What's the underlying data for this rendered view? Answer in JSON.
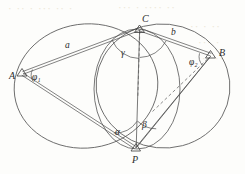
{
  "figure": {
    "background_color": "#fdfdfb",
    "ink_color": "#4a4a4a",
    "points": [
      {
        "id": "A",
        "label": "A",
        "x": 22,
        "y": 73,
        "label_dx": -10,
        "label_dy": 4
      },
      {
        "id": "B",
        "label": "B",
        "x": 211,
        "y": 55,
        "label_dx": 8,
        "label_dy": 0
      },
      {
        "id": "C",
        "label": "C",
        "x": 140,
        "y": 29,
        "label_dx": 3,
        "label_dy": -7
      },
      {
        "id": "P",
        "label": "P",
        "x": 136,
        "y": 148,
        "label_dx": 1,
        "label_dy": 13
      }
    ],
    "side_labels": [
      {
        "id": "a",
        "label": "a",
        "x": 68,
        "y": 45
      },
      {
        "id": "b",
        "label": "b",
        "x": 174,
        "y": 32
      }
    ],
    "angle_labels": [
      {
        "id": "gamma",
        "label": "γ",
        "x": 125,
        "y": 52
      },
      {
        "id": "phi1",
        "label": "φ₁",
        "x": 36,
        "y": 76
      },
      {
        "id": "phi2",
        "label": "φ₂",
        "x": 195,
        "y": 61
      },
      {
        "id": "alpha",
        "label": "α",
        "x": 119,
        "y": 131
      },
      {
        "id": "beta",
        "label": "β",
        "x": 146,
        "y": 124
      }
    ],
    "circles": [
      {
        "id": "left-circle",
        "cx": 86,
        "cy": 86,
        "rx": 72,
        "ry": 62,
        "rotate": -8
      },
      {
        "id": "right-circle",
        "cx": 163,
        "cy": 86,
        "rx": 67,
        "ry": 62,
        "rotate": 6
      },
      {
        "id": "middle-circle",
        "cx": 137,
        "cy": 89,
        "rx": 43,
        "ry": 60,
        "rotate": 0
      }
    ],
    "segments": [
      {
        "id": "AC",
        "from": "A",
        "to": "C",
        "style": "double"
      },
      {
        "id": "CB",
        "from": "C",
        "to": "B",
        "style": "double"
      },
      {
        "id": "AP",
        "from": "A",
        "to": "P",
        "style": "double"
      },
      {
        "id": "CP",
        "from": "C",
        "to": "P",
        "style": "solid"
      },
      {
        "id": "BP",
        "from": "B",
        "to": "P",
        "style": "solid"
      },
      {
        "id": "C-vertical",
        "from": "C",
        "to": "P",
        "style": "dashed"
      },
      {
        "id": "B-dashed",
        "from": "B",
        "to": "P",
        "style": "dashed"
      }
    ]
  },
  "background_text": [
    {
      "text": "· ·· · ··· ·· ·",
      "x": 8,
      "y": 4
    },
    {
      "text": "··· · ···· ··",
      "x": 118,
      "y": 3
    },
    {
      "text": "·· · ··",
      "x": 190,
      "y": 22
    },
    {
      "text": "··· ·",
      "x": 196,
      "y": 38
    },
    {
      "text": "·· ··",
      "x": 200,
      "y": 54
    }
  ]
}
